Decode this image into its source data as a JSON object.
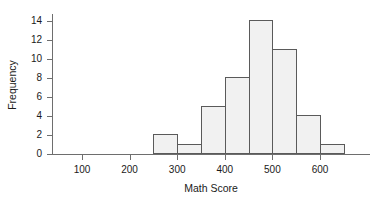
{
  "chart_data": {
    "type": "bar",
    "title": "",
    "xlabel": "Math Score",
    "ylabel": "Frequency",
    "xlim": [
      50,
      720
    ],
    "ylim": [
      0,
      14.7
    ],
    "grid": false,
    "legend": null,
    "bin_width": 50,
    "bin_edges": [
      250,
      300,
      350,
      400,
      450,
      500,
      550,
      600,
      650
    ],
    "categories": [
      "250-300",
      "300-350",
      "350-400",
      "400-450",
      "450-500",
      "500-550",
      "550-600",
      "600-650"
    ],
    "values": [
      2,
      1,
      5,
      8,
      14,
      11,
      4,
      1
    ],
    "bin_centers": [
      275,
      325,
      375,
      425,
      475,
      525,
      575,
      625
    ],
    "x_ticks": [
      100,
      200,
      300,
      400,
      500,
      600
    ],
    "x_tick_labels": [
      "100",
      "200",
      "300",
      "400",
      "500",
      "600"
    ],
    "y_ticks": [
      0,
      2,
      4,
      6,
      8,
      10,
      12,
      14
    ],
    "y_tick_labels": [
      "0",
      "2",
      "4",
      "6",
      "8",
      "10",
      "12",
      "14"
    ],
    "total_count": 46,
    "colors": {
      "bar_fill": "#f1f1f1",
      "bar_stroke": "#5a5a5a",
      "axis": "#6e6e6e",
      "text": "#1a1a1a",
      "background": "#ffffff"
    }
  }
}
